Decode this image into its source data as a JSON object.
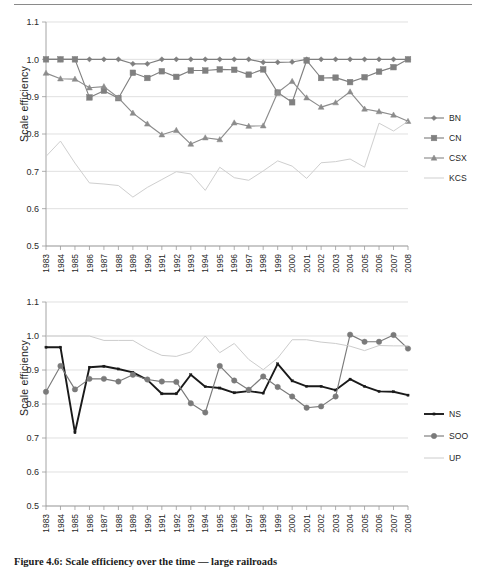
{
  "figure": {
    "caption": "Figure 4.6: Scale efficiency over the time — large railroads",
    "ylabel_top": "Scale efficiency",
    "ylabel_bottom": "Scale efficiency"
  },
  "axis": {
    "y_ticks": [
      "0.5",
      "0.6",
      "0.7",
      "0.8",
      "0.9",
      "1.0",
      "1.1"
    ],
    "y_min": 0.5,
    "y_max": 1.1,
    "x_ticks": [
      "1983",
      "1984",
      "1985",
      "1986",
      "1987",
      "1988",
      "1989",
      "1990",
      "1991",
      "1992",
      "1993",
      "1994",
      "1995",
      "1996",
      "1997",
      "1998",
      "1999",
      "2000",
      "2001",
      "2002",
      "2003",
      "2004",
      "2005",
      "2006",
      "2007",
      "2008"
    ]
  },
  "colors": {
    "bn": "#7f7f7f",
    "cn": "#808080",
    "csx": "#8c8c8c",
    "kcs": "#cfcfcf",
    "ns": "#1a1a1a",
    "soo": "#7a7a7a",
    "up": "#cccccc",
    "grid": "#d2d2d2",
    "axis": "#9a9a9a"
  },
  "chart_data": [
    {
      "type": "line",
      "title": "",
      "xlabel": "",
      "ylabel": "Scale efficiency",
      "ylim": [
        0.5,
        1.1
      ],
      "grid": true,
      "legend_position": "right",
      "categories": [
        "1983",
        "1984",
        "1985",
        "1986",
        "1987",
        "1988",
        "1989",
        "1990",
        "1991",
        "1992",
        "1993",
        "1994",
        "1995",
        "1996",
        "1997",
        "1998",
        "1999",
        "2000",
        "2001",
        "2002",
        "2003",
        "2004",
        "2005",
        "2006",
        "2007",
        "2008"
      ],
      "series": [
        {
          "name": "BN",
          "marker": "diamond",
          "color": "#7f7f7f",
          "values": [
            1.0,
            1.0,
            1.0,
            1.0,
            1.0,
            1.0,
            0.988,
            0.988,
            1.0,
            1.0,
            1.0,
            1.0,
            1.0,
            1.0,
            1.0,
            0.992,
            0.992,
            0.993,
            1.0,
            1.0,
            1.0,
            1.0,
            1.0,
            1.0,
            1.0,
            1.0
          ]
        },
        {
          "name": "CN",
          "marker": "square",
          "color": "#808080",
          "values": [
            1.0,
            1.0,
            1.0,
            0.898,
            0.916,
            0.896,
            0.964,
            0.95,
            0.968,
            0.953,
            0.97,
            0.97,
            0.973,
            0.972,
            0.959,
            0.973,
            0.911,
            0.885,
            0.997,
            0.95,
            0.951,
            0.939,
            0.952,
            0.967,
            0.979,
            1.0
          ]
        },
        {
          "name": "CSX",
          "marker": "triangle",
          "color": "#8c8c8c",
          "values": [
            0.963,
            0.948,
            0.947,
            0.924,
            0.927,
            0.897,
            0.856,
            0.827,
            0.798,
            0.81,
            0.773,
            0.79,
            0.785,
            0.83,
            0.821,
            0.822,
            0.911,
            0.941,
            0.897,
            0.872,
            0.884,
            0.913,
            0.867,
            0.86,
            0.851,
            0.834
          ]
        },
        {
          "name": "KCS",
          "marker": "none",
          "color": "#cfcfcf",
          "values": [
            0.74,
            0.781,
            0.722,
            0.669,
            0.666,
            0.662,
            0.631,
            0.657,
            0.678,
            0.699,
            0.693,
            0.649,
            0.711,
            0.683,
            0.676,
            0.701,
            0.728,
            0.714,
            0.681,
            0.723,
            0.726,
            0.733,
            0.711,
            0.829,
            0.808,
            0.834
          ]
        }
      ]
    },
    {
      "type": "line",
      "title": "",
      "xlabel": "",
      "ylabel": "Scale efficiency",
      "ylim": [
        0.5,
        1.1
      ],
      "grid": true,
      "legend_position": "right",
      "categories": [
        "1983",
        "1984",
        "1985",
        "1986",
        "1987",
        "1988",
        "1989",
        "1990",
        "1991",
        "1992",
        "1993",
        "1994",
        "1995",
        "1996",
        "1997",
        "1998",
        "1999",
        "2000",
        "2001",
        "2002",
        "2003",
        "2004",
        "2005",
        "2006",
        "2007",
        "2008"
      ],
      "series": [
        {
          "name": "NS",
          "marker": "small",
          "color": "#1a1a1a",
          "values": [
            0.967,
            0.967,
            0.716,
            0.908,
            0.911,
            0.903,
            0.893,
            0.871,
            0.83,
            0.83,
            0.886,
            0.851,
            0.847,
            0.833,
            0.838,
            0.832,
            0.918,
            0.868,
            0.852,
            0.852,
            0.841,
            0.873,
            0.852,
            0.837,
            0.836,
            0.826
          ]
        },
        {
          "name": "SOO",
          "marker": "circle",
          "color": "#7a7a7a",
          "values": [
            0.836,
            0.912,
            0.843,
            0.874,
            0.874,
            0.866,
            0.886,
            0.872,
            0.866,
            0.865,
            0.802,
            0.775,
            0.912,
            0.869,
            0.842,
            0.881,
            0.85,
            0.822,
            0.789,
            0.793,
            0.822,
            1.004,
            0.983,
            0.983,
            1.003,
            0.963
          ]
        },
        {
          "name": "UP",
          "marker": "none",
          "color": "#cccccc",
          "values": [
            1.0,
            1.0,
            1.0,
            1.0,
            0.987,
            0.987,
            0.987,
            0.962,
            0.943,
            0.94,
            0.953,
            1.0,
            0.951,
            0.978,
            0.931,
            0.901,
            0.935,
            0.989,
            0.989,
            0.982,
            0.978,
            0.97,
            0.957,
            0.972,
            0.971,
            0.971
          ]
        }
      ]
    }
  ],
  "legends": [
    {
      "items": [
        {
          "label": "BN"
        },
        {
          "label": "CN"
        },
        {
          "label": "CSX"
        },
        {
          "label": "KCS"
        }
      ]
    },
    {
      "items": [
        {
          "label": "NS"
        },
        {
          "label": "SOO"
        },
        {
          "label": "UP"
        }
      ]
    }
  ]
}
